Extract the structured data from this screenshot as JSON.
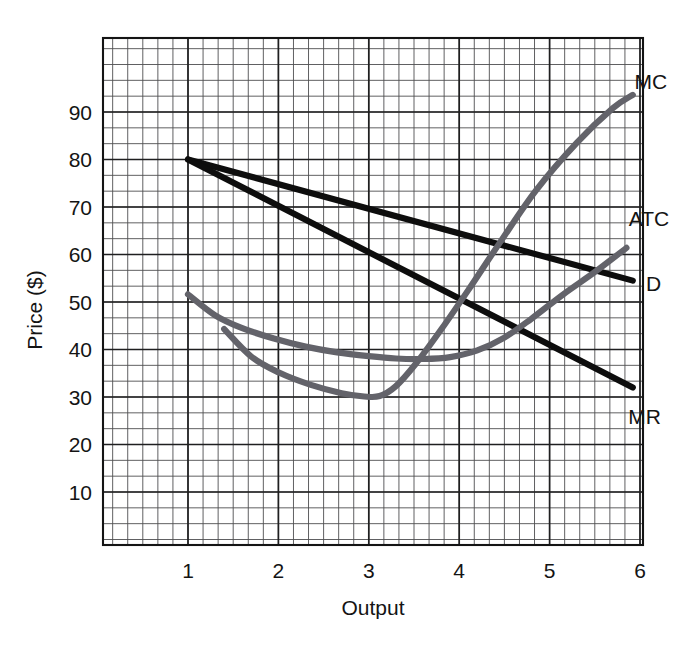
{
  "figure": {
    "caption_rules": {
      "top_rule": "thick-dark-rule",
      "bottom_rule": "thin-gray-rule"
    }
  },
  "chart_data": {
    "type": "line",
    "title": "",
    "xlabel": "Output",
    "ylabel": "Price ($)",
    "xlim": [
      0,
      6.55
    ],
    "ylim": [
      0,
      107
    ],
    "xticks": [
      1,
      2,
      3,
      4,
      5,
      6
    ],
    "xtick_labels": [
      "1",
      "2",
      "3",
      "4",
      "5",
      "6"
    ],
    "yticks": [
      10,
      20,
      30,
      40,
      50,
      60,
      70,
      80,
      90
    ],
    "ytick_labels": [
      "10",
      "20",
      "30",
      "40",
      "50",
      "60",
      "70",
      "80",
      "90"
    ],
    "grid": "minor-and-major",
    "grid_minor_step_x": 0.1667,
    "grid_minor_step_y": 3.3333,
    "legend_position": "inline-right-of-curve-ends",
    "series": [
      {
        "name": "D",
        "label": "D",
        "color": "#0d0d0d",
        "style": "thick-black-line",
        "points": [
          [
            1,
            80
          ],
          [
            5.92,
            54.5
          ]
        ],
        "label_point": [
          6.15,
          53.8
        ]
      },
      {
        "name": "MR",
        "label": "MR",
        "color": "#0d0d0d",
        "style": "thick-black-line",
        "points": [
          [
            1,
            80
          ],
          [
            5.92,
            32.0
          ]
        ],
        "label_point": [
          6.05,
          26.0
        ]
      },
      {
        "name": "MC",
        "label": "MC",
        "color": "#63636a",
        "style": "thick-gray-curve",
        "points": [
          [
            1.4,
            44.3
          ],
          [
            1.7,
            38.5
          ],
          [
            2.0,
            35.2
          ],
          [
            2.35,
            32.6
          ],
          [
            2.7,
            30.8
          ],
          [
            2.95,
            30.1
          ],
          [
            3.12,
            30.2
          ],
          [
            3.3,
            32.3
          ],
          [
            3.52,
            37.0
          ],
          [
            3.8,
            44.2
          ],
          [
            4.1,
            52.5
          ],
          [
            4.45,
            62.5
          ],
          [
            4.85,
            73.5
          ],
          [
            5.3,
            83.5
          ],
          [
            5.7,
            90.8
          ],
          [
            5.92,
            93.6
          ]
        ],
        "label_point": [
          6.12,
          96.5
        ]
      },
      {
        "name": "ATC",
        "label": "ATC",
        "color": "#63636a",
        "style": "thick-gray-curve",
        "points": [
          [
            1.0,
            51.6
          ],
          [
            1.3,
            47.2
          ],
          [
            1.6,
            44.5
          ],
          [
            1.95,
            42.3
          ],
          [
            2.3,
            40.6
          ],
          [
            2.65,
            39.4
          ],
          [
            3.0,
            38.6
          ],
          [
            3.3,
            38.1
          ],
          [
            3.6,
            38.0
          ],
          [
            3.9,
            38.4
          ],
          [
            4.2,
            39.8
          ],
          [
            4.5,
            42.5
          ],
          [
            4.8,
            46.5
          ],
          [
            5.15,
            51.6
          ],
          [
            5.5,
            56.3
          ],
          [
            5.85,
            61.4
          ]
        ],
        "label_point": [
          6.1,
          67.5
        ]
      }
    ],
    "annotations": [
      {
        "text": "MC",
        "at": [
          6.12,
          96.5
        ],
        "dash_left": true,
        "dash_right": true
      },
      {
        "text": "ATC",
        "at": [
          6.1,
          67.5
        ],
        "dash_left": true,
        "dash_right": true
      },
      {
        "text": "D",
        "at": [
          6.15,
          53.8
        ],
        "dash_left": true,
        "dash_right": true
      },
      {
        "text": "MR",
        "at": [
          6.05,
          26.0
        ],
        "dash_left": false,
        "dash_right": true
      }
    ]
  }
}
